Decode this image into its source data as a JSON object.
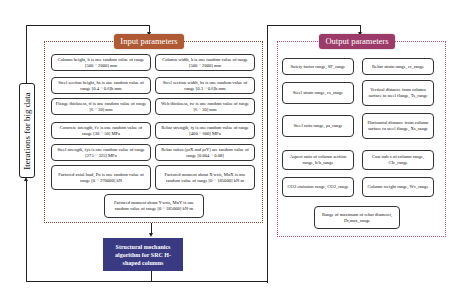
{
  "loop": {
    "label": "Iterations for big data"
  },
  "input": {
    "title": "Input parameters",
    "color": "#b05a35",
    "items": [
      "Column height, h is one random value of range [500 ~ 2000] mm",
      "Column width, b is one random value of range [500 ~ 2000] mm",
      "Steel section height, hs is one random value of range [0.4 ~ 0.6]h mm",
      "Steel section width, bs is one random value of range [0.3 ~ 0.6]b mm",
      "Flange thickness, tf is one random value of range [6 ~ 30] mm",
      "Web thickness, tw is one random value of range [6 ~ 30] mm",
      "Concrete strength, f'c is one random value of range [30 ~ 50] MPa",
      "Rebar strength, fy is one random value of range [400 ~ 600] MPa",
      "Steel strength, fys is one random value of range [275 ~ 325] MPa",
      "Rebar ratios (ρrX and ρrY) are random value of range [0.004 ~ 0.08]",
      "Factored axial load, Pu is one random value of range [0 ~ 270000] kN",
      "Factored moment about X-axis, MuX is one random value of range [0 ~ 185000] kN m",
      "Factored moment about Y-axis, MuY is one random value of range [0 ~ 185000] kN·m"
    ]
  },
  "algorithm": {
    "label": "Structural mechanics algorithm for SRC H-shaped columns",
    "color": "#3a3a82"
  },
  "output": {
    "title": "Output parameters",
    "color": "#9c3a6a",
    "items": [
      "Safety factor range, SF_range",
      "Rebar strain range, εr_range",
      "Steel strain range, εs_range",
      "Vertical distance from column surface to steel flange, Ts_range",
      "Steel ratio range, ρs_range",
      "Horizontal distance from column surface to steel flange, Xs_range",
      "Aspect ratio of column section range, h/b_range",
      "Cost index of column range, CIc_range",
      "CO2 emission range, CO2_range",
      "Column weight range, Wc_range",
      "Range of maximum of rebar diameter, Dr,max_range"
    ]
  }
}
